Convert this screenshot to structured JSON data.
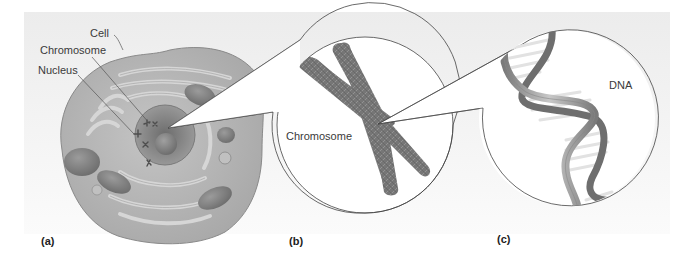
{
  "figure": {
    "panels": [
      {
        "id": "a",
        "label": "(a)",
        "subject": "Cell"
      },
      {
        "id": "b",
        "label": "(b)",
        "subject": "Chromosome"
      },
      {
        "id": "c",
        "label": "(c)",
        "subject": "DNA"
      }
    ],
    "cell_labels": {
      "cell": "Cell",
      "chromosome": "Chromosome",
      "nucleus": "Nucleus"
    },
    "zoom_labels": {
      "chromosome": "Chromosome",
      "dna": "DNA"
    },
    "colors": {
      "background_panel": "#efefef",
      "cell_fill": "#b9b9b9",
      "cytoplasm_organelle": "#cfcfcf",
      "nucleus_fill": "#8a8a8a",
      "chromosome_fill": "#7b7b7b",
      "dna_strand": "#9a9a9a",
      "outline": "#555555"
    }
  }
}
